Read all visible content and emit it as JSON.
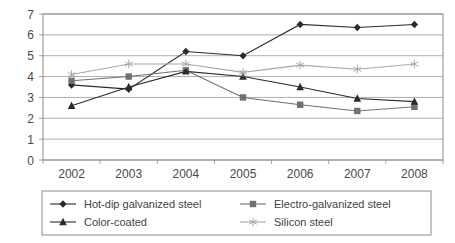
{
  "chart_data": {
    "type": "line",
    "title": "",
    "subtitle": "",
    "xlabel": "",
    "ylabel": "",
    "categories": [
      "2002",
      "2003",
      "2004",
      "2005",
      "2006",
      "2007",
      "2008"
    ],
    "x_tick_labels": [
      "2002",
      "2003",
      "2004",
      "2005",
      "2006",
      "2007",
      "2008"
    ],
    "y_tick_labels": [
      "0",
      "1",
      "2",
      "3",
      "4",
      "5",
      "6",
      "7"
    ],
    "ylim": [
      0,
      7
    ],
    "y_tick_step": 1,
    "grid": "horizontal",
    "legend_position": "bottom",
    "legend_columns": 2,
    "series": [
      {
        "name": "Hot-dip galvanized steel",
        "marker": "diamond",
        "color": "#2b2b2b",
        "values": [
          3.6,
          3.4,
          5.2,
          5.0,
          6.5,
          6.35,
          6.5
        ]
      },
      {
        "name": "Electro-galvanized steel",
        "marker": "square",
        "color": "#707070",
        "values": [
          3.8,
          4.0,
          4.3,
          3.0,
          2.65,
          2.35,
          2.55
        ]
      },
      {
        "name": "Color-coated",
        "marker": "triangle",
        "color": "#2b2b2b",
        "values": [
          2.6,
          3.5,
          4.25,
          4.0,
          3.5,
          2.95,
          2.8
        ]
      },
      {
        "name": "Silicon steel",
        "marker": "star",
        "color": "#a8a8a8",
        "values": [
          4.1,
          4.6,
          4.6,
          4.2,
          4.55,
          4.35,
          4.6
        ]
      }
    ]
  },
  "legend": {
    "entries": [
      {
        "label": "Hot-dip galvanized steel"
      },
      {
        "label": "Electro-galvanized steel"
      },
      {
        "label": "Color-coated"
      },
      {
        "label": "Silicon steel"
      }
    ]
  },
  "colors": {
    "plot_border": "#8c8c8c",
    "gridline": "#9a9a9a",
    "legend_border": "#8c8c8c",
    "background": "#ffffff",
    "text": "#4a4a4a"
  }
}
